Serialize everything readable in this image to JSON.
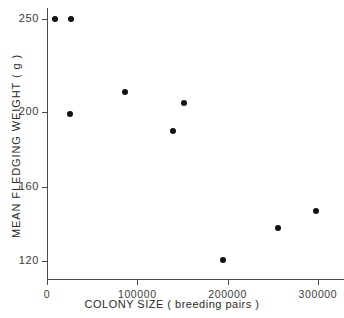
{
  "chart_data": {
    "type": "scatter",
    "title": "",
    "xlabel": "COLONY SIZE ( breeding pairs )",
    "ylabel": "MEAN FLEDGING WEIGHT ( g )",
    "xlim": [
      0,
      330000
    ],
    "ylim": [
      110,
      256
    ],
    "grid": false,
    "legend": null,
    "xticks": [
      0,
      100000,
      200000,
      300000
    ],
    "xticklabels": [
      "0",
      "100000",
      "200000",
      "300000"
    ],
    "yticks": [
      120,
      160,
      200,
      250
    ],
    "yticklabels": [
      "120",
      "160",
      "200",
      "250"
    ],
    "marker": "filled-circle",
    "marker_color": "#111111",
    "axis_color": "#4a4a4a",
    "points": [
      {
        "x": 9000,
        "y": 250
      },
      {
        "x": 27000,
        "y": 250
      },
      {
        "x": 25000,
        "y": 199
      },
      {
        "x": 86000,
        "y": 211
      },
      {
        "x": 139000,
        "y": 190
      },
      {
        "x": 152000,
        "y": 205
      },
      {
        "x": 195000,
        "y": 121
      },
      {
        "x": 256000,
        "y": 138
      },
      {
        "x": 298000,
        "y": 147
      }
    ]
  }
}
